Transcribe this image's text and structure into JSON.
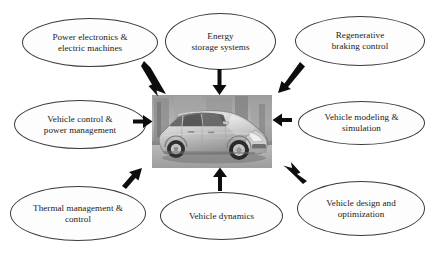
{
  "diagram": {
    "center": {
      "name": "hybrid-vehicle-photo",
      "caption": "Silver hybrid electric passenger car, three-quarter front view"
    },
    "nodes": [
      {
        "id": "power-electronics",
        "label": "Power electronics &\nelectric machines",
        "position": "top-left"
      },
      {
        "id": "energy-storage",
        "label": "Energy\nstorage systems",
        "position": "top-center"
      },
      {
        "id": "regen-braking",
        "label": "Regenerative\nbraking control",
        "position": "top-right"
      },
      {
        "id": "vehicle-control",
        "label": "Vehicle control &\npower management",
        "position": "middle-left"
      },
      {
        "id": "vehicle-modeling",
        "label": "Vehicle modeling &\nsimulation",
        "position": "middle-right"
      },
      {
        "id": "thermal-management",
        "label": "Thermal management &\ncontrol",
        "position": "bottom-left"
      },
      {
        "id": "vehicle-dynamics",
        "label": "Vehicle dynamics",
        "position": "bottom-center"
      },
      {
        "id": "vehicle-design",
        "label": "Vehicle design and\noptimization",
        "position": "bottom-right"
      }
    ],
    "arrows": [
      {
        "from": "power-electronics",
        "to": "hybrid-vehicle-photo",
        "direction": "down-right"
      },
      {
        "from": "energy-storage",
        "to": "hybrid-vehicle-photo",
        "direction": "down"
      },
      {
        "from": "regen-braking",
        "to": "hybrid-vehicle-photo",
        "direction": "down-left"
      },
      {
        "from": "vehicle-control",
        "to": "hybrid-vehicle-photo",
        "direction": "right"
      },
      {
        "from": "vehicle-modeling",
        "to": "hybrid-vehicle-photo",
        "direction": "left"
      },
      {
        "from": "thermal-management",
        "to": "hybrid-vehicle-photo",
        "direction": "up-right"
      },
      {
        "from": "vehicle-dynamics",
        "to": "hybrid-vehicle-photo",
        "direction": "up"
      },
      {
        "from": "vehicle-design",
        "to": "hybrid-vehicle-photo",
        "direction": "up-left"
      }
    ],
    "colors": {
      "background": "#ffffff",
      "node_border": "#3b3b3b",
      "node_fill": "#fdfdfd",
      "text": "#1a1a1a",
      "arrow": "#0d0d0d"
    }
  }
}
